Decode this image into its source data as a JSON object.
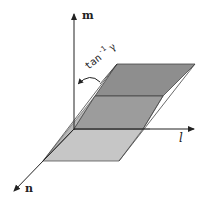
{
  "figure": {
    "axes": {
      "m": {
        "label": "m"
      },
      "l": {
        "label": "l"
      },
      "n": {
        "label": "n"
      }
    },
    "angle_annotation": {
      "base": "tan",
      "superscript": "-1",
      "symbol": "γ"
    },
    "colors": {
      "upper_plane": "#8f8f8f",
      "lower_plane": "#c4c4c4",
      "side_plane": "#b4b4b4",
      "lines": "#333333"
    }
  }
}
